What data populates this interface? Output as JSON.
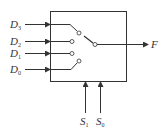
{
  "diagram": {
    "type": "4-to-1 multiplexer (switch model)",
    "inputs": [
      {
        "name": "D",
        "sub": "3",
        "y": 24
      },
      {
        "name": "D",
        "sub": "2",
        "y": 41
      },
      {
        "name": "D",
        "sub": "1",
        "y": 53
      },
      {
        "name": "D",
        "sub": "0",
        "y": 69
      }
    ],
    "output": {
      "name": "F"
    },
    "selects": [
      {
        "name": "S",
        "sub": "1"
      },
      {
        "name": "S",
        "sub": "0"
      }
    ],
    "colors": {
      "stroke": "#333333",
      "background": "#ffffff"
    }
  }
}
